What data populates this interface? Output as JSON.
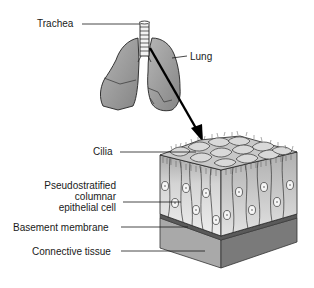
{
  "diagram": {
    "labels": {
      "trachea": "Trachea",
      "lung": "Lung",
      "cilia": "Cilia",
      "pseudo_line1": "Pseudostratified",
      "pseudo_line2": "columnar",
      "pseudo_line3": "epithelial cell",
      "basement_membrane": "Basement membrane",
      "connective_tissue": "Connective tissue"
    },
    "colors": {
      "line": "#1a1a1a",
      "lung_fill": "#9a9a9a",
      "lung_dark": "#7c7c7c",
      "cell_light": "#e6e6e6",
      "cell_mid": "#bdbdbd",
      "membrane": "#6e6e6e",
      "tissue_front": "#a8a8a8",
      "tissue_side": "#7a7a7a"
    }
  }
}
